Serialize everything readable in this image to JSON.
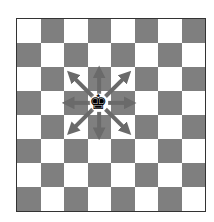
{
  "diagram": {
    "type": "chessboard",
    "files": 8,
    "ranks": 8,
    "top_left_square": "light",
    "colors": {
      "light": "#ffffff",
      "dark": "#7f7f7f",
      "arrow": "#6a6a6a",
      "piece": "#000000"
    },
    "piece": {
      "type": "king",
      "color": "black",
      "glyph": "♚",
      "col": 3,
      "row": 3
    },
    "arrows": [
      {
        "dir": "N"
      },
      {
        "dir": "NE"
      },
      {
        "dir": "E"
      },
      {
        "dir": "SE"
      },
      {
        "dir": "S"
      },
      {
        "dir": "SW"
      },
      {
        "dir": "W"
      },
      {
        "dir": "NW"
      }
    ]
  }
}
